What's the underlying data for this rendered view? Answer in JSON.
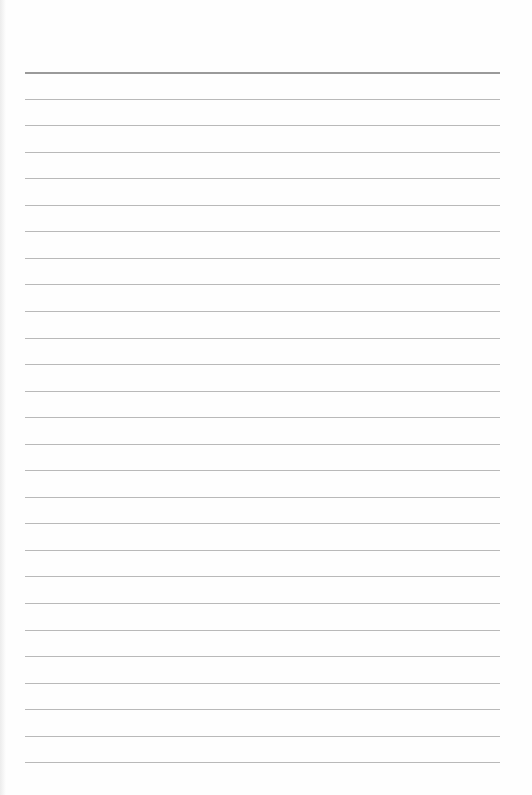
{
  "document": {
    "type": "lined-paper",
    "line_count": 27,
    "first_line_y": 72,
    "line_spacing": 26.55,
    "line_left": 25,
    "line_width": 475,
    "colors": {
      "paper": "#fefefe",
      "rule": "#b9b9b9",
      "header_rule": "#9a9a9a"
    }
  }
}
